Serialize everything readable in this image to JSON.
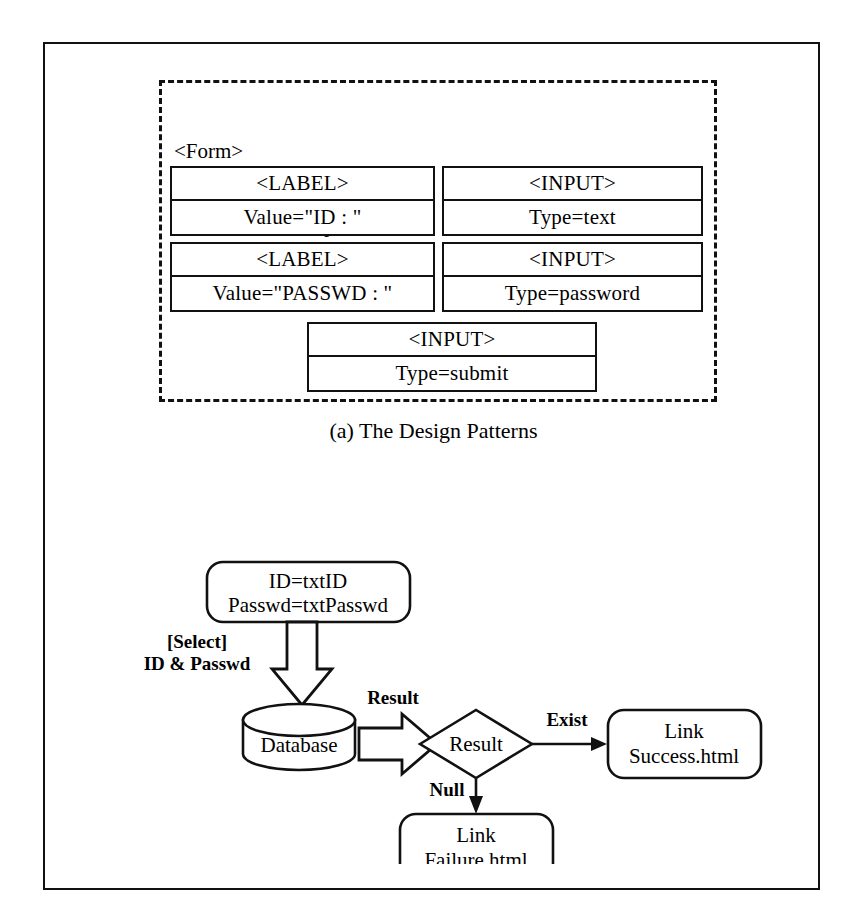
{
  "figure": {
    "panel_a": {
      "caption": "(a) The Design Patterns",
      "form": {
        "tag": "<Form>",
        "action": "Action : Check.asp",
        "method": "Method : post"
      },
      "elements": [
        {
          "id": "label-id",
          "title": "<LABEL>",
          "value": "Value=\"ID : \""
        },
        {
          "id": "input-id",
          "title": "<INPUT>",
          "value": "Type=text"
        },
        {
          "id": "label-passwd",
          "title": "<LABEL>",
          "value": "Value=\"PASSWD : \""
        },
        {
          "id": "input-passwd",
          "title": "<INPUT>",
          "value": "Type=password"
        },
        {
          "id": "input-submit",
          "title": "<INPUT>",
          "value": "Type=submit"
        }
      ]
    },
    "panel_b": {
      "caption": "(b) The Functional Flows",
      "nodes": {
        "inputs": {
          "line1": "ID=txtID",
          "line2": "Passwd=txtPasswd"
        },
        "database": "Database",
        "decision": "Result",
        "success": {
          "line1": "Link",
          "line2": "Success.html"
        },
        "failure": {
          "line1": "Link",
          "line2": "Failure.html"
        }
      },
      "edges": {
        "select_line1": "[Select]",
        "select_line2": "ID & Passwd",
        "result": "Result",
        "exist": "Exist",
        "null": "Null"
      }
    }
  },
  "colors": {
    "ink": "#111111",
    "paper": "#ffffff"
  }
}
